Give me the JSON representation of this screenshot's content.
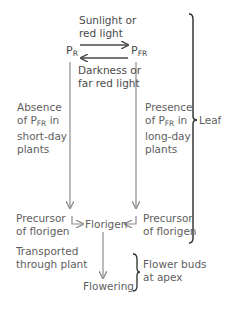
{
  "diagram": {
    "type": "photoperiod-florigen-flow",
    "nodes": {
      "pr": {
        "base": "P",
        "sub": "R"
      },
      "pfr": {
        "base": "P",
        "sub": "FR"
      },
      "florigen": "Florigen",
      "flowering": "Flowering",
      "precursor_left": [
        "Precursor",
        "of florigen"
      ],
      "precursor_right": [
        "Precursor",
        "of florigen"
      ]
    },
    "edges": {
      "to_pfr": [
        "Sunlight or",
        "red light"
      ],
      "to_pr": [
        "Darkness or",
        "far red light"
      ],
      "left_branch": {
        "lines": [
          "Absence",
          "of P",
          "short-day",
          "plants"
        ],
        "sub": "FR",
        "after_sub": " in"
      },
      "right_branch": {
        "lines": [
          "Presence",
          "of P",
          "long-day",
          "plants"
        ],
        "sub": "FR",
        "after_sub": " in"
      },
      "transport": [
        "Transported",
        "through plant"
      ]
    },
    "braces": {
      "leaf": "Leaf",
      "apex": [
        "Flower buds",
        "at apex"
      ]
    },
    "colors": {
      "arrow_dark": "#4a4a4a",
      "arrow_gray": "#8c8c8c",
      "text": "#5e5e5e",
      "brace": "#2b2b2b"
    }
  }
}
